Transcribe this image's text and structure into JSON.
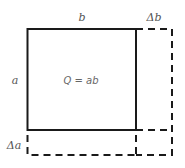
{
  "diagram": {
    "type": "area-increment",
    "labels": {
      "top_side": "b",
      "top_increment": "Δb",
      "left_side": "a",
      "left_increment": "Δa",
      "area": "Q = ab"
    },
    "colors": {
      "stroke": "#1a1a1a",
      "text": "#555555",
      "background": "#ffffff"
    }
  }
}
